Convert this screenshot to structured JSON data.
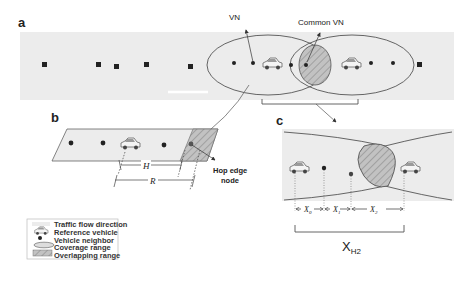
{
  "figure": {
    "panels": {
      "a": {
        "letter": "a",
        "labels": {
          "vn": "VN",
          "common_vn": "Common VN"
        }
      },
      "b": {
        "letter": "b",
        "labels": {
          "h": "H",
          "r": "R",
          "hop_edge_line1": "Hop edge",
          "hop_edge_line2": "node"
        }
      },
      "c": {
        "letter": "c",
        "labels": {
          "x0": "X",
          "x0_sub": "0",
          "x1": "X",
          "x1_sub": "1",
          "x2": "X",
          "x2_sub": "2",
          "xh2": "X",
          "xh2_sub": "H2"
        }
      }
    },
    "legend": {
      "items": [
        {
          "icon": "traffic-flow-icon",
          "label": "Traffic flow direction"
        },
        {
          "icon": "car-icon",
          "label": "Reference vehicle"
        },
        {
          "icon": "dot-icon",
          "label": "Vehicle neighbor"
        },
        {
          "icon": "ellipse-icon",
          "label": "Coverage range"
        },
        {
          "icon": "hatch-icon",
          "label": "Overlapping range"
        }
      ]
    },
    "colors": {
      "road": "#ececec",
      "line": "#555555",
      "overlap": "#b8b8b8",
      "hatch": "#888888",
      "node": "#222222"
    }
  }
}
